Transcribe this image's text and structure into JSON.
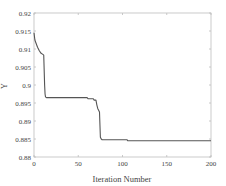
{
  "chart_data": {
    "type": "line",
    "title": "",
    "xlabel": "Iteration Number",
    "ylabel": "Y",
    "xlim": [
      0,
      200
    ],
    "ylim": [
      0.88,
      0.92
    ],
    "x_ticks": [
      0,
      50,
      100,
      150,
      200
    ],
    "x_tick_labels": [
      "0",
      "50",
      "100",
      "150",
      "200"
    ],
    "y_ticks": [
      0.88,
      0.885,
      0.89,
      0.895,
      0.9,
      0.905,
      0.91,
      0.915,
      0.92
    ],
    "y_tick_labels": [
      "0.88",
      "0.885",
      "0.89",
      "0.895",
      "0.9",
      "0.905",
      "0.91",
      "0.915",
      "0.92"
    ],
    "grid": false,
    "legend": null,
    "series": [
      {
        "name": "Y",
        "color": "#555555",
        "x": [
          0,
          1,
          2,
          4,
          6,
          8,
          10,
          11,
          12,
          12.5,
          13,
          14,
          20,
          40,
          60,
          61,
          62,
          67,
          68,
          70,
          71,
          72,
          73,
          74,
          75,
          76,
          77,
          90,
          105,
          106,
          150,
          200
        ],
        "y": [
          0.9145,
          0.9125,
          0.9118,
          0.9105,
          0.9095,
          0.9088,
          0.9085,
          0.9083,
          0.9,
          0.8975,
          0.8967,
          0.8965,
          0.8965,
          0.8965,
          0.8965,
          0.8962,
          0.8962,
          0.8962,
          0.8958,
          0.8958,
          0.8945,
          0.8935,
          0.893,
          0.8925,
          0.8855,
          0.885,
          0.8848,
          0.8848,
          0.8848,
          0.8845,
          0.8845,
          0.8845
        ]
      }
    ]
  },
  "layout": {
    "plot_left": 34,
    "plot_top": 13,
    "plot_right": 211,
    "plot_bottom": 157
  }
}
